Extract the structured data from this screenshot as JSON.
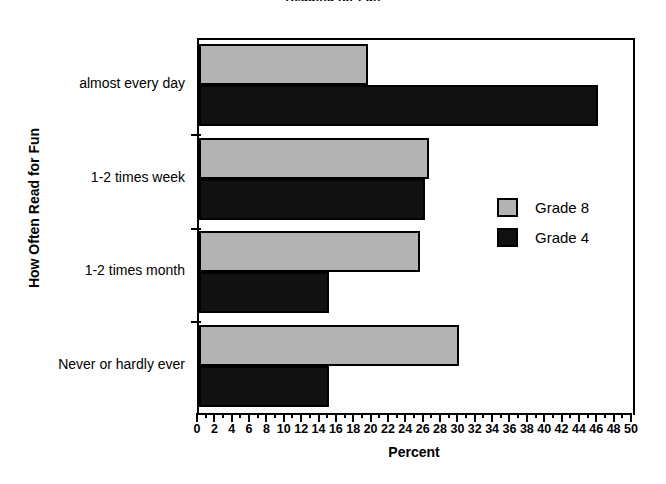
{
  "chart_data": {
    "type": "bar",
    "orientation": "horizontal",
    "title": "Reading for Fun",
    "xlabel": "Percent",
    "ylabel": "How Often Read for Fun",
    "categories": [
      "almost every day",
      "1-2 times week",
      "1-2 times month",
      "Never or hardly ever"
    ],
    "series": [
      {
        "name": "Grade 8",
        "color": "#b3b3b3",
        "values": [
          19.5,
          26.5,
          25.5,
          30
        ]
      },
      {
        "name": "Grade 4",
        "color": "#111111",
        "values": [
          46,
          26,
          15,
          15
        ]
      }
    ],
    "xlim": [
      0,
      50
    ],
    "xtick_step": 2,
    "xticks": [
      0,
      2,
      4,
      6,
      8,
      10,
      12,
      14,
      16,
      18,
      20,
      22,
      24,
      26,
      28,
      30,
      32,
      34,
      36,
      38,
      40,
      42,
      44,
      46,
      48,
      50
    ],
    "grid": false,
    "legend_position": "middle-right"
  },
  "legend": {
    "items": [
      {
        "label": "Grade 8",
        "color": "#b3b3b3"
      },
      {
        "label": "Grade 4",
        "color": "#111111"
      }
    ]
  }
}
